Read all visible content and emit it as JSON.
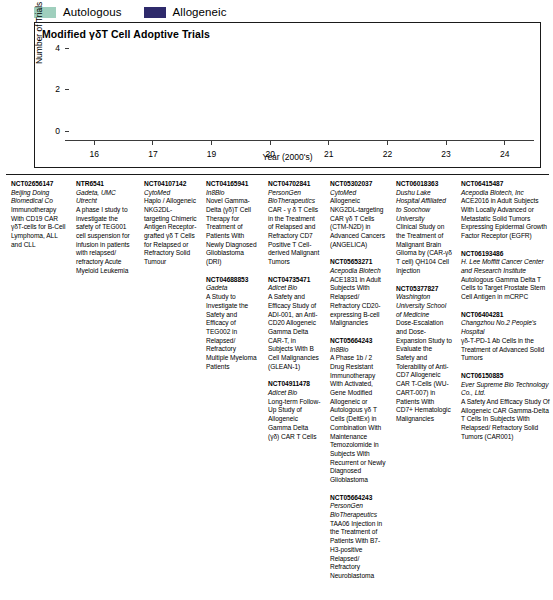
{
  "legend": {
    "items": [
      {
        "label": "Autologous",
        "color": "#9fcfbd",
        "name": "legend-autologous"
      },
      {
        "label": "Allogeneic",
        "color": "#2e2a6b",
        "name": "legend-allogeneic"
      }
    ]
  },
  "chart_data": {
    "type": "bar",
    "stacked": true,
    "title": "Modified γδT Cell Adoptive Trials",
    "xlabel": "Year (2000's)",
    "ylabel": "Number of Trials Published",
    "categories": [
      "16",
      "17",
      "19",
      "20",
      "21",
      "22",
      "23",
      "24"
    ],
    "series": [
      {
        "name": "Autologous",
        "color": "#9fcfbd",
        "values": [
          0,
          1,
          0,
          2,
          0,
          1,
          0,
          1
        ]
      },
      {
        "name": "Allogeneic",
        "color": "#2e2a6b",
        "values": [
          1,
          0,
          1,
          0,
          3,
          3,
          2,
          3
        ]
      }
    ],
    "totals": [
      1,
      1,
      1,
      2,
      3,
      4,
      2,
      4
    ],
    "ylim": [
      0,
      4.6
    ],
    "yticks": [
      "0",
      "2",
      "4"
    ],
    "ytick_values": [
      0,
      2,
      4
    ],
    "grid": false,
    "legend_position": "above-left"
  },
  "trial_columns": [
    {
      "year": "16",
      "entries": [
        {
          "nct": "NCT02656147",
          "sponsor": "Beijing Doing Biomedical Co",
          "desc": "Immunotherapy With CD19 CAR γδT-cells for B-Cell Lymphoma, ALL and CLL"
        }
      ]
    },
    {
      "year": "17",
      "entries": [
        {
          "nct": "NTR6541",
          "sponsor": "Gadeta, UMC Utrecht",
          "desc": "A phase I study to investigate the safety of TEG001 cell suspension for infusion in patients with relapsed/ refractory Acute Myeloid Leukemia"
        }
      ]
    },
    {
      "year": "19",
      "entries": [
        {
          "nct": "NCT04107142",
          "sponsor": "CytoMed",
          "desc": "Haplo / Allogeneic NKG2DL-targeting Chimeric Antigen Receptor-grafted γδ T Cells for Relapsed or Refractory Solid Tumour"
        }
      ]
    },
    {
      "year": "20",
      "entries": [
        {
          "nct": "NCT04165941",
          "sponsor": "In8Bio",
          "desc": "Novel Gamma-Delta (γδ)T Cell Therapy for Treatment of Patients With Newly Diagnosed Glioblastoma (DRI)"
        },
        {
          "nct": "NCT04688853",
          "sponsor": "Gadeta",
          "desc": "A Study to Investigate the Safety and Efficacy of TEG002 in Relapsed/ Refractory Multiple Myeloma Patients"
        }
      ]
    },
    {
      "year": "21",
      "entries": [
        {
          "nct": "NCT04702841",
          "sponsor": "PersonGen BioTherapeutics",
          "desc": "CAR - γ δ T Cells in the Treatment of Relapsed and Refractory CD7 Positive T Cell-derived Malignant Tumors"
        },
        {
          "nct": "NCT04735471",
          "sponsor": "Adicet Bio",
          "desc": "A Safety and Efficacy Study of ADI-001, an Anti-CD20 Allogeneic Gamma Delta CAR-T, in Subjects With B Cell Malignancies (GLEAN-1)"
        },
        {
          "nct": "NCT04911478",
          "sponsor": "Adicet Bio",
          "desc": "Long-term Follow-Up Study of Allogeneic Gamma Delta (γδ) CAR T Cells"
        }
      ]
    },
    {
      "year": "22",
      "entries": [
        {
          "nct": "NCT05302037",
          "sponsor": "CytoMed",
          "desc": "Allogeneic NKG2DL-targeting CAR γδ T Cells (CTM-N2D) in Advanced Cancers (ANGELICA)"
        },
        {
          "nct": "NCT05653271",
          "sponsor": "Acepodia Biotech",
          "desc": "ACE1831 in Adult Subjects With Relapsed/ Refractory CD20-expressing B-cell Malignancies"
        },
        {
          "nct": "NCT05664243",
          "sponsor": "In8Bio",
          "desc": "A Phase 1b / 2 Drug Resistant Immunotherapy With Activated, Gene Modified Allogeneic or Autologous γδ T Cells (DeltEx) in Combination With Maintenance Temozolomide in Subjects With Recurrent or Newly Diagnosed Glioblastoma"
        },
        {
          "nct": "NCT05664243",
          "sponsor": "PersonGen BioTherapeutics",
          "desc": "TAA06 Injection in the Treatment of Patients With B7-H3-positive Relapsed/ Refractory Neuroblastoma"
        }
      ]
    },
    {
      "year": "23",
      "entries": [
        {
          "nct": "NCT06018363",
          "sponsor": "Dushu Lake Hospital Affiliated to Soochow University",
          "desc": "Clinical Study on the Treatment of Malignant Brain Glioma by (CAR-γδ T cell) QH104 Cell Injection"
        },
        {
          "nct": "NCT05377827",
          "sponsor": "Washington University School of Medicine",
          "desc": "Dose-Escalation and Dose-Expansion Study to Evaluate the Safety and Tolerability of Anti-CD7 Allogeneic CAR T-Cells (WU-CART-007) in Patients With CD7+ Hematologic Malignancies"
        }
      ]
    },
    {
      "year": "24",
      "entries": [
        {
          "nct": "NCT06415487",
          "sponsor": "Acepodia Biotech, Inc",
          "desc": "ACE2016 in Adult Subjects With Locally Advanced or Metastatic Solid Tumors Expressing Epidermal Growth Factor Receptor (EGFR)"
        },
        {
          "nct": "NCT06193486",
          "sponsor": "H. Lee Moffitt Cancer Center and Research Institute",
          "desc": "Autologous Gamma Delta T Cells to Target Prostate Stem Cell Antigen in mCRPC"
        },
        {
          "nct": "NCT06404281",
          "sponsor": "Changzhou No.2 People's Hospital",
          "desc": "γδ-T-PD-1 Ab Cells in the Treatment of Advanced Solid Tumors"
        },
        {
          "nct": "NCT06150885",
          "sponsor": "Ever Supreme Bio Technology Co., Ltd.",
          "desc": "A Safety And Efficacy Study Of Allogeneic CAR Gamma-Delta T Cells In Subjects With Relapsed/ Refractory Solid Tumors (CAR001)"
        }
      ]
    }
  ]
}
